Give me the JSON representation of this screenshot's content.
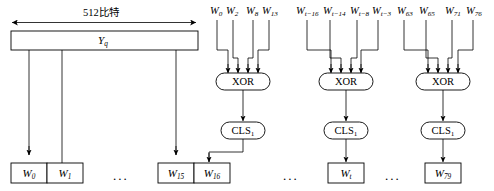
{
  "diagram": {
    "title_note": "512比特",
    "block": {
      "label_main": "Y",
      "label_sub": "q"
    },
    "width_label": "512比特",
    "ellipsis": "...",
    "xor_label": "XOR",
    "cls_label_main": "CLS",
    "cls_label_sub": "1",
    "xor_groups": [
      {
        "inputs": [
          {
            "main": "W",
            "sub": "0"
          },
          {
            "main": "W",
            "sub": "2"
          },
          {
            "main": "W",
            "sub": "8"
          },
          {
            "main": "W",
            "sub": "13"
          }
        ],
        "output": {
          "main": "W",
          "sub": "16"
        }
      },
      {
        "inputs": [
          {
            "main": "W",
            "sub": "t−16"
          },
          {
            "main": "W",
            "sub": "t−14"
          },
          {
            "main": "W",
            "sub": "t−8"
          },
          {
            "main": "W",
            "sub": "t−3"
          }
        ],
        "output": {
          "main": "W",
          "sub": "t"
        }
      },
      {
        "inputs": [
          {
            "main": "W",
            "sub": "63"
          },
          {
            "main": "W",
            "sub": "65"
          },
          {
            "main": "W",
            "sub": "71"
          },
          {
            "main": "W",
            "sub": "76"
          }
        ],
        "output": {
          "main": "W",
          "sub": "79"
        }
      }
    ],
    "word_boxes": [
      {
        "main": "W",
        "sub": "0"
      },
      {
        "main": "W",
        "sub": "1"
      },
      {
        "main": "W",
        "sub": "15"
      },
      {
        "main": "W",
        "sub": "16"
      },
      {
        "main": "W",
        "sub": "t"
      },
      {
        "main": "W",
        "sub": "79"
      }
    ],
    "colors": {
      "stroke": "#000000",
      "background": "#ffffff",
      "text": "#000000"
    }
  }
}
